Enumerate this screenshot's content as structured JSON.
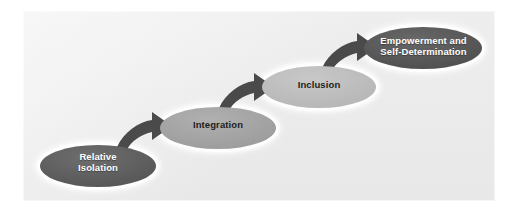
{
  "figure": {
    "panel_background": "#ececec",
    "page_background": "#ffffff",
    "arrow_color": "#4a4a4a",
    "glow_color": "#ffffff"
  },
  "stages": [
    {
      "id": "stage-1",
      "order": 1,
      "label": "Relative\nIsolation",
      "fill": "#5c5c5c",
      "text_color": "#ffffff",
      "cx": 98,
      "cy": 166,
      "rx": 58,
      "ry": 21
    },
    {
      "id": "stage-2",
      "order": 2,
      "label": "Integration",
      "fill": "#a3a3a3",
      "text_color": "#1d1d1d",
      "cx": 218,
      "cy": 128,
      "rx": 58,
      "ry": 21
    },
    {
      "id": "stage-3",
      "order": 3,
      "label": "Inclusion",
      "fill": "#bdbdbd",
      "text_color": "#1d1d1d",
      "cx": 319,
      "cy": 87,
      "rx": 57,
      "ry": 21
    },
    {
      "id": "stage-4",
      "order": 4,
      "label": "Empowerment and\nSelf-Determination",
      "fill": "#555555",
      "text_color": "#ffffff",
      "cx": 423,
      "cy": 48,
      "rx": 59,
      "ry": 21
    }
  ],
  "arrows": [
    {
      "id": "arrow-1",
      "from": "stage-1",
      "to": "stage-2",
      "direction": "up-right",
      "color": "#4a4a4a"
    },
    {
      "id": "arrow-2",
      "from": "stage-2",
      "to": "stage-3",
      "direction": "up-right",
      "color": "#4a4a4a"
    },
    {
      "id": "arrow-3",
      "from": "stage-3",
      "to": "stage-4",
      "direction": "up-right",
      "color": "#4a4a4a"
    }
  ]
}
